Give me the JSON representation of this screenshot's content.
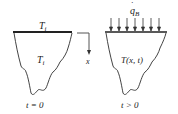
{
  "diagram": {
    "left": {
      "surface_label": "T_i",
      "surface_main": "T",
      "surface_sub": "i",
      "body_main": "T",
      "body_sub": "i",
      "caption": "t = 0"
    },
    "axis": {
      "label": "x"
    },
    "right": {
      "flux_main": "q",
      "flux_sub": "B",
      "flux_dot": "·",
      "body_label": "T(x, t)",
      "caption": "t > 0",
      "arrow_count": 7
    },
    "colors": {
      "line": "#333333",
      "surface": "#222222"
    }
  }
}
